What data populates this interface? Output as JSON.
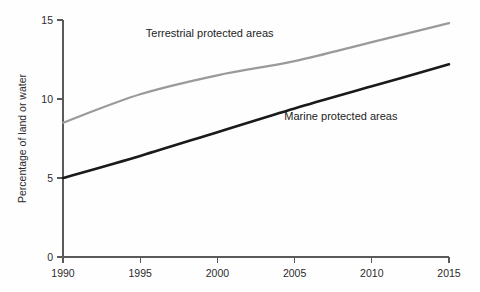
{
  "chart_data": {
    "type": "line",
    "title": "",
    "subtitle": "",
    "xlabel": "",
    "ylabel": "Percentage of land or water",
    "xlim": [
      1990,
      2015
    ],
    "ylim": [
      0,
      15
    ],
    "grid": false,
    "legend_position": "inline-annotations",
    "xticks": [
      "1990",
      "1995",
      "2000",
      "2005",
      "2010",
      "2015"
    ],
    "xtick_values": [
      1990,
      1995,
      2000,
      2005,
      2010,
      2015
    ],
    "yticks": [
      "0",
      "5",
      "10",
      "15"
    ],
    "ytick_values": [
      0,
      5,
      10,
      15
    ],
    "x": [
      1990,
      1995,
      2000,
      2005,
      2010,
      2015
    ],
    "series": [
      {
        "name": "Terrestrial protected areas",
        "color": "#9a9a9a",
        "values": [
          8.5,
          10.3,
          11.5,
          12.4,
          13.6,
          14.8
        ]
      },
      {
        "name": "Marine protected areas",
        "color": "#1a1a1a",
        "values": [
          5.0,
          6.4,
          7.9,
          9.4,
          10.8,
          12.2
        ]
      }
    ],
    "annotations": [
      {
        "text": "Terrestrial protected areas",
        "x": 1999.5,
        "y": 13.9
      },
      {
        "text": "Marine protected areas",
        "x": 2008.0,
        "y": 8.7
      }
    ]
  }
}
